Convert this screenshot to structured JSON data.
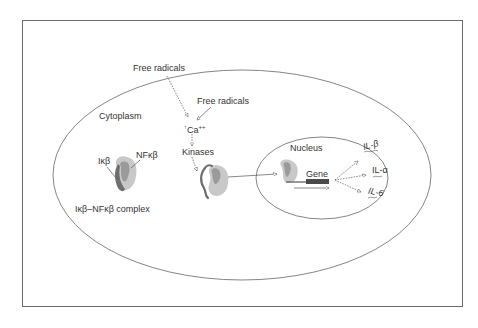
{
  "diagram": {
    "labels": {
      "free_radicals_1": "Free radicals",
      "free_radicals_2": "Free radicals",
      "cytoplasm": "Cytoplasm",
      "calcium": "Ca",
      "calcium_sup": "++",
      "calcium_arrow": "↑",
      "kinases": "Kinases",
      "ikb": "Iκβ",
      "nfkb": "NFκβ",
      "complex": "Iκβ–NFκβ complex",
      "nucleus": "Nucleus",
      "gene": "Gene",
      "il_beta": "IL-β",
      "il_alpha": "IL-α",
      "il_6": "IL-6"
    },
    "colors": {
      "line": "#555555",
      "protein_light": "#c8c8c8",
      "protein_mid": "#9a9a9a",
      "protein_dark": "#6e6e6e",
      "gene_bar": "#4a4a4a"
    }
  }
}
